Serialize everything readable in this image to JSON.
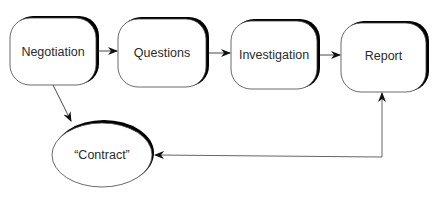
{
  "diagram": {
    "type": "flowchart",
    "nodes": [
      {
        "id": "negotiation",
        "label": "Negotiation",
        "shape": "rounded-rect"
      },
      {
        "id": "questions",
        "label": "Questions",
        "shape": "rounded-rect"
      },
      {
        "id": "investigation",
        "label": "Investigation",
        "shape": "rounded-rect"
      },
      {
        "id": "report",
        "label": "Report",
        "shape": "rounded-rect"
      },
      {
        "id": "contract",
        "label": "“Contract”",
        "shape": "ellipse"
      }
    ],
    "edges": [
      {
        "from": "negotiation",
        "to": "questions"
      },
      {
        "from": "questions",
        "to": "investigation"
      },
      {
        "from": "investigation",
        "to": "report"
      },
      {
        "from": "negotiation",
        "to": "contract"
      },
      {
        "from": "report",
        "to": "contract",
        "bidirectional": true
      }
    ],
    "colors": {
      "stroke": "#333333",
      "shadow": "#000000",
      "fill": "#ffffff",
      "text": "#2a2a2a"
    }
  }
}
